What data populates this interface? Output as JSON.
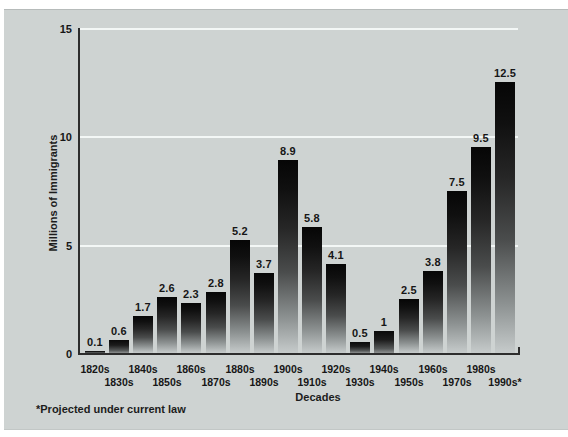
{
  "figure": {
    "y_axis_title": "Millions of Immigrants",
    "x_axis_title": "Decades",
    "footnote": "*Projected under current law"
  },
  "chart_data": {
    "type": "bar",
    "title": "",
    "xlabel": "Decades",
    "ylabel": "Millions of Immigrants",
    "categories": [
      "1820s",
      "1830s",
      "1840s",
      "1850s",
      "1860s",
      "1870s",
      "1880s",
      "1890s",
      "1900s",
      "1910s",
      "1920s",
      "1930s",
      "1940s",
      "1950s",
      "1960s",
      "1970s",
      "1980s",
      "1990s*"
    ],
    "values": [
      0.1,
      0.6,
      1.7,
      2.6,
      2.3,
      2.8,
      5.2,
      3.7,
      8.9,
      5.8,
      4.1,
      0.5,
      1,
      2.5,
      3.8,
      7.5,
      9.5,
      12.5
    ],
    "value_labels": [
      "0.1",
      "0.6",
      "1.7",
      "2.6",
      "2.3",
      "2.8",
      "5.2",
      "3.7",
      "8.9",
      "5.8",
      "4.1",
      "0.5",
      "1",
      "2.5",
      "3.8",
      "7.5",
      "9.5",
      "12.5"
    ],
    "ylim": [
      0,
      15
    ],
    "yticks": [
      0,
      5,
      10,
      15
    ],
    "grid": "horizontal white gridlines at 5, 10, 15",
    "legend": "none",
    "bar_style": "vertical gradient, black at top fading to light gray at base",
    "x_label_layout": "staggered two rows",
    "footnote": "*Projected under current law",
    "colors": {
      "background": "#ced3d2",
      "bar_top": "#060606",
      "bar_bottom": "#c6cbcb",
      "gridline": "#f3f7f6",
      "axis": "#2d2d2d",
      "text": "#1c1c1c",
      "page": "#ffffff"
    }
  }
}
